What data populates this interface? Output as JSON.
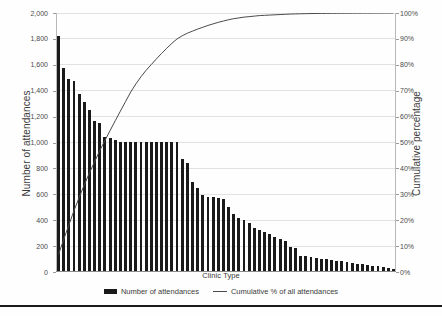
{
  "chart_data": {
    "type": "bar",
    "title": "",
    "subtitle": "",
    "xlabel": "Clinic Type",
    "ylabel": "Number of attendances",
    "ylabel_secondary": "Cumulative percentage",
    "ylim": [
      0,
      2000
    ],
    "ylim_secondary": [
      0,
      100
    ],
    "ytick_labels": [
      "0",
      "200",
      "400",
      "600",
      "800",
      "1,000",
      "1,200",
      "1,400",
      "1,600",
      "1,800",
      "2,000"
    ],
    "ytick_values": [
      0,
      200,
      400,
      600,
      800,
      1000,
      1200,
      1400,
      1600,
      1800,
      2000
    ],
    "ytick_labels_secondary": [
      "0%",
      "10%",
      "20%",
      "30%",
      "40%",
      "50%",
      "60%",
      "70%",
      "80%",
      "90%",
      "100%"
    ],
    "ytick_values_secondary": [
      0,
      10,
      20,
      30,
      40,
      50,
      60,
      70,
      80,
      90,
      100
    ],
    "grid": true,
    "legend_position": "bottom",
    "categories": [
      "Clinic 1",
      "Clinic 2",
      "Clinic 3",
      "Clinic 4",
      "Clinic 5",
      "Clinic 6",
      "Clinic 7",
      "Clinic 8",
      "Clinic 9",
      "Clinic 10",
      "Clinic 11",
      "Clinic 12",
      "Clinic 13",
      "Clinic 14",
      "Clinic 15",
      "Clinic 16",
      "Clinic 17",
      "Clinic 18",
      "Clinic 19",
      "Clinic 20",
      "Clinic 21",
      "Clinic 22",
      "Clinic 23",
      "Clinic 24",
      "Clinic 25",
      "Clinic 26",
      "Clinic 27",
      "Clinic 28",
      "Clinic 29",
      "Clinic 30",
      "Clinic 31",
      "Clinic 32",
      "Clinic 33",
      "Clinic 34",
      "Clinic 35",
      "Clinic 36",
      "Clinic 37",
      "Clinic 38",
      "Clinic 39",
      "Clinic 40",
      "Clinic 41",
      "Clinic 42",
      "Clinic 43",
      "Clinic 44",
      "Clinic 45",
      "Clinic 46",
      "Clinic 47",
      "Clinic 48",
      "Clinic 49",
      "Clinic 50",
      "Clinic 51",
      "Clinic 52",
      "Clinic 53",
      "Clinic 54",
      "Clinic 55",
      "Clinic 56",
      "Clinic 57",
      "Clinic 58",
      "Clinic 59",
      "Clinic 60",
      "Clinic 61",
      "Clinic 62",
      "Clinic 63",
      "Clinic 64",
      "Clinic 65",
      "Clinic 66"
    ],
    "series": [
      {
        "name": "Number of attendances",
        "type": "bar",
        "axis": "left",
        "color": "#1a1a1a",
        "values": [
          1820,
          1570,
          1490,
          1475,
          1375,
          1310,
          1245,
          1160,
          1150,
          1040,
          1035,
          1015,
          1000,
          1000,
          1000,
          1000,
          1000,
          1000,
          1000,
          1000,
          1000,
          1000,
          1000,
          1000,
          870,
          835,
          690,
          640,
          590,
          575,
          570,
          565,
          555,
          500,
          445,
          410,
          395,
          375,
          330,
          320,
          300,
          285,
          265,
          245,
          230,
          185,
          180,
          120,
          115,
          108,
          100,
          95,
          90,
          85,
          80,
          75,
          70,
          62,
          58,
          52,
          48,
          42,
          38,
          32,
          25,
          18
        ]
      },
      {
        "name": "Cumulative % of all attendances",
        "type": "line",
        "axis": "right",
        "color": "#4a4a4a",
        "values": [
          6.8,
          12.6,
          18.2,
          23.7,
          28.8,
          33.7,
          38.3,
          42.6,
          46.9,
          50.8,
          54.6,
          58.4,
          62.1,
          65.8,
          69.5,
          72.6,
          75.4,
          77.9,
          80.1,
          82.3,
          84.4,
          86.4,
          88.3,
          90.0,
          91.2,
          92.2,
          93.0,
          93.8,
          94.5,
          95.2,
          95.8,
          96.4,
          96.9,
          97.4,
          97.8,
          98.1,
          98.4,
          98.6,
          98.8,
          99.0,
          99.1,
          99.2,
          99.3,
          99.4,
          99.5,
          99.6,
          99.65,
          99.7,
          99.74,
          99.78,
          99.81,
          99.84,
          99.86,
          99.88,
          99.9,
          99.92,
          99.93,
          99.94,
          99.95,
          99.96,
          99.97,
          99.98,
          99.985,
          99.99,
          99.995,
          100.0
        ]
      }
    ],
    "legend": [
      {
        "label": "Number of attendances",
        "marker": "bar",
        "color": "#1a1a1a"
      },
      {
        "label": "Cumulative % of all attendances",
        "marker": "line",
        "color": "#4a4a4a"
      }
    ]
  }
}
